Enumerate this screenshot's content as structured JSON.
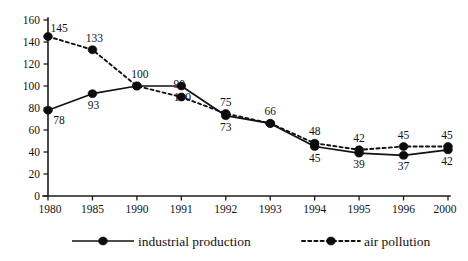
{
  "chart_data": {
    "type": "line",
    "title": "",
    "subtitle": "",
    "xlabel": "",
    "ylabel": "",
    "categories": [
      "1980",
      "1985",
      "1990",
      "1991",
      "1992",
      "1993",
      "1994",
      "1995",
      "1996",
      "2000"
    ],
    "ylim": [
      0,
      160
    ],
    "yticks": [
      "0",
      "20",
      "40",
      "60",
      "80",
      "100",
      "120",
      "140",
      "160"
    ],
    "ytick_values": [
      0,
      20,
      40,
      60,
      80,
      100,
      120,
      140,
      160
    ],
    "grid": false,
    "legend_position": "bottom",
    "series": [
      {
        "name": "industrial production",
        "style": "solid",
        "marker": "filled-circle",
        "label_position": "below",
        "values": [
          78,
          93,
          100,
          100,
          73,
          66,
          45,
          39,
          37,
          42
        ],
        "labels": [
          "78",
          "93",
          "100",
          "100",
          "73",
          "66",
          "45",
          "39",
          "37",
          "42"
        ]
      },
      {
        "name": "air pollution",
        "style": "dotted",
        "marker": "filled-circle",
        "label_position": "above",
        "values": [
          145,
          133,
          100,
          90,
          75,
          66,
          48,
          42,
          45,
          45
        ],
        "labels": [
          "145",
          "133",
          "100",
          "90",
          "75",
          "66",
          "48",
          "42",
          "45",
          "45"
        ]
      }
    ],
    "colors": {
      "line": "#111111",
      "marker": "#0c0c0c",
      "axis": "#1c1c1c",
      "text": "#131313",
      "background": "#ffffff"
    }
  },
  "legend": {
    "items": [
      {
        "label": "industrial production",
        "style": "solid"
      },
      {
        "label": "air pollution",
        "style": "dotted"
      }
    ]
  }
}
